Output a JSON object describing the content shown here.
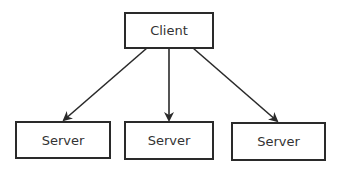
{
  "diagram": {
    "type": "tree",
    "nodes": [
      {
        "id": "client",
        "label": "Client",
        "role": "root"
      },
      {
        "id": "server1",
        "label": "Server",
        "role": "leaf"
      },
      {
        "id": "server2",
        "label": "Server",
        "role": "leaf"
      },
      {
        "id": "server3",
        "label": "Server",
        "role": "leaf"
      }
    ],
    "edges": [
      {
        "from": "client",
        "to": "server1"
      },
      {
        "from": "client",
        "to": "server2"
      },
      {
        "from": "client",
        "to": "server3"
      }
    ],
    "colors": {
      "stroke": "#2a2a2a",
      "text": "#333333",
      "background": "#ffffff"
    }
  }
}
